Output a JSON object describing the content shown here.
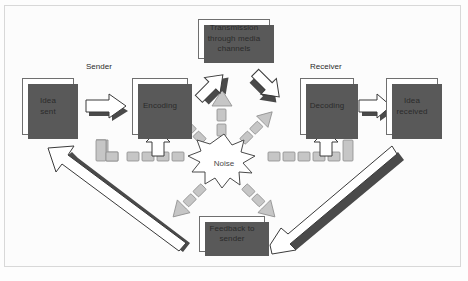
{
  "diagram": {
    "background": "#fdfdfd",
    "frame_color": "#d8d8d8",
    "box_fill": "#ffffff",
    "box_border": "#6f6f6f",
    "shadow_color": "#595959",
    "arrow_fill": "#ffffff",
    "arrow_shadow": "#4a4a4a",
    "dash_fill": "#c6c6c6",
    "dash_border": "#8d8d8d"
  },
  "captions": {
    "sender": "Sender",
    "receiver": "Receiver"
  },
  "nodes": {
    "idea_sent": "Idea\nsent",
    "idea_sent_l1": "Idea",
    "idea_sent_l2": "sent",
    "encoding": "Encoding",
    "transmission_l1": "Transmission",
    "transmission_l2": "through media",
    "transmission_l3": "channels",
    "decoding": "Decoding",
    "idea_received_l1": "Idea",
    "idea_received_l2": "received",
    "feedback_l1": "Feedback to",
    "feedback_l2": "sender",
    "noise": "Noise"
  }
}
